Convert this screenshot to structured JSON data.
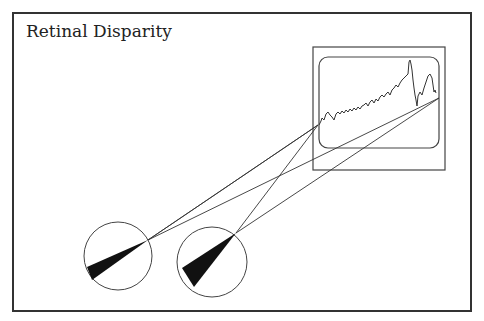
{
  "title": "Retinal Disparity",
  "diagram": {
    "elements": [
      "monitor showing stock-price line chart",
      "left eye",
      "right eye",
      "sight lines from each eye to the two edges of the chart"
    ],
    "colors": {
      "stroke": "#333333",
      "fill": "#111111",
      "background": "#ffffff"
    }
  }
}
